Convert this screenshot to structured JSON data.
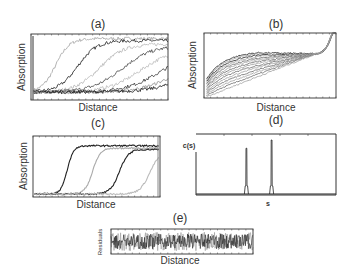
{
  "figure": {
    "panels": [
      {
        "id": "a",
        "label": "(a)",
        "xlabel": "Distance",
        "ylabel": "Absorption"
      },
      {
        "id": "b",
        "label": "(b)",
        "xlabel": "Distance",
        "ylabel": "Absorption"
      },
      {
        "id": "c",
        "label": "(c)",
        "xlabel": "Distance",
        "ylabel": "Absorption"
      },
      {
        "id": "d",
        "label": "(d)",
        "xlabel": "s",
        "ylabel": "c(s)"
      },
      {
        "id": "e",
        "label": "(e)",
        "xlabel": "Distance",
        "ylabel": "Residuals"
      }
    ]
  },
  "chart_data": [
    {
      "id": "a",
      "type": "line",
      "title": "(a)",
      "xlabel": "Distance",
      "ylabel": "Absorption",
      "xlim": [
        0,
        1
      ],
      "ylim": [
        0,
        1
      ],
      "description": "Sedimentation boundaries moving right over time, broad boundaries, noisy",
      "series": [
        {
          "name": "scan1",
          "midpoint": 0.18,
          "width": 0.05,
          "plateau": 0.93,
          "color": "#aaaaaa"
        },
        {
          "name": "scan2",
          "midpoint": 0.34,
          "width": 0.07,
          "plateau": 0.9,
          "color": "#333333"
        },
        {
          "name": "scan3",
          "midpoint": 0.5,
          "width": 0.09,
          "plateau": 0.85,
          "color": "#bbbbbb"
        },
        {
          "name": "scan4",
          "midpoint": 0.66,
          "width": 0.11,
          "plateau": 0.82,
          "color": "#555555"
        },
        {
          "name": "scan5",
          "midpoint": 0.8,
          "width": 0.12,
          "plateau": 0.78,
          "color": "#c0c0c0"
        },
        {
          "name": "scan6",
          "midpoint": 0.95,
          "width": 0.13,
          "plateau": 0.75,
          "color": "#444444"
        },
        {
          "name": "scan7",
          "midpoint": 1.08,
          "width": 0.13,
          "plateau": 0.72,
          "color": "#999999"
        },
        {
          "name": "scan8",
          "midpoint": 1.2,
          "width": 0.14,
          "plateau": 0.7,
          "color": "#222222"
        }
      ],
      "baseline": 0.12
    },
    {
      "id": "b",
      "type": "line",
      "title": "(b)",
      "xlabel": "Distance",
      "ylabel": "Absorption",
      "xlim": [
        0,
        1
      ],
      "ylim": [
        0,
        1
      ],
      "description": "Approach to equilibrium curves converging near x=0.85, rising steeply at right edge",
      "series_count": 14,
      "converge_point": [
        0.85,
        0.68
      ],
      "first_curve_start": 0.3,
      "last_curve_start": 0.02
    },
    {
      "id": "c",
      "type": "line",
      "title": "(c)",
      "xlabel": "Distance",
      "ylabel": "Absorption",
      "xlim": [
        0,
        1
      ],
      "ylim": [
        0,
        1
      ],
      "description": "Sharp sedimentation boundaries",
      "series": [
        {
          "name": "scan1",
          "midpoint": 0.27,
          "width": 0.025,
          "plateau": 0.84,
          "color": "#222222"
        },
        {
          "name": "scan2",
          "midpoint": 0.47,
          "width": 0.03,
          "plateau": 0.8,
          "color": "#aaaaaa"
        },
        {
          "name": "scan3",
          "midpoint": 0.68,
          "width": 0.035,
          "plateau": 0.78,
          "color": "#222222"
        },
        {
          "name": "scan4",
          "midpoint": 0.92,
          "width": 0.04,
          "plateau": 0.75,
          "color": "#bbbbbb"
        }
      ],
      "baseline": 0.05
    },
    {
      "id": "d",
      "type": "line",
      "title": "(d)",
      "xlabel": "s",
      "ylabel": "c(s)",
      "xlim": [
        0,
        1
      ],
      "ylim": [
        0,
        1
      ],
      "description": "Sedimentation coefficient distribution with two sharp peaks",
      "peaks": [
        {
          "position": 0.36,
          "height": 0.85
        },
        {
          "position": 0.54,
          "height": 1.0
        }
      ]
    },
    {
      "id": "e",
      "type": "line",
      "title": "(e)",
      "xlabel": "Distance",
      "ylabel": "Residuals",
      "xlim": [
        0,
        1
      ],
      "ylim": [
        -1,
        1
      ],
      "description": "Random noise residuals around zero"
    }
  ]
}
